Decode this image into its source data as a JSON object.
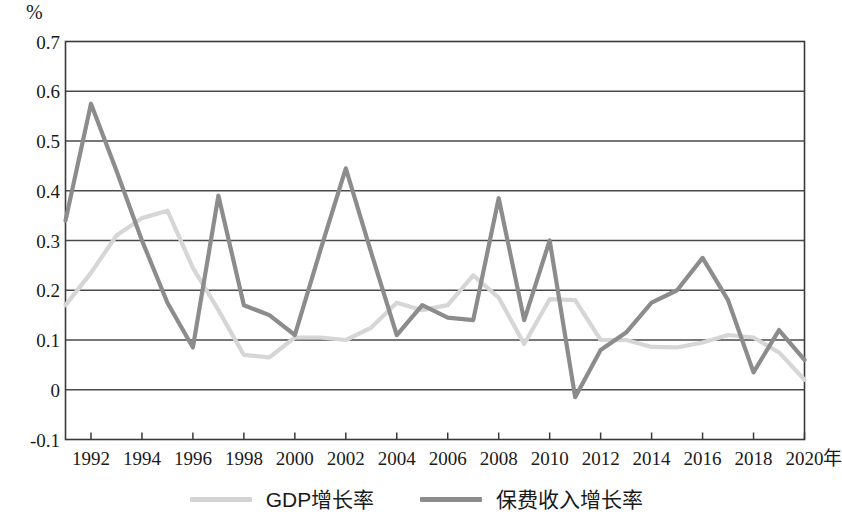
{
  "axes": {
    "y_unit": "%",
    "x_unit": "年",
    "y_ticks": [
      "0.7",
      "0.6",
      "0.5",
      "0.4",
      "0.3",
      "0.2",
      "0.1",
      "0",
      "-0.1"
    ],
    "x_ticks": [
      "1992",
      "1994",
      "1996",
      "1998",
      "2000",
      "2002",
      "2004",
      "2006",
      "2008",
      "2010",
      "2012",
      "2014",
      "2016",
      "2018",
      "2020"
    ]
  },
  "legend": {
    "items": [
      {
        "label": "GDP增长率",
        "color": "#d3d3d3"
      },
      {
        "label": "保费收入增长率",
        "color": "#8c8c8c"
      }
    ]
  },
  "chart_data": {
    "type": "line",
    "title": "",
    "xlabel": "年",
    "ylabel": "%",
    "ylim": [
      -0.1,
      0.7
    ],
    "xlim": [
      1991,
      2020
    ],
    "grid": true,
    "legend_position": "bottom",
    "x": [
      1991,
      1992,
      1993,
      1994,
      1995,
      1996,
      1997,
      1998,
      1999,
      2000,
      2001,
      2002,
      2003,
      2004,
      2005,
      2006,
      2007,
      2008,
      2009,
      2010,
      2011,
      2012,
      2013,
      2014,
      2015,
      2016,
      2017,
      2018,
      2019,
      2020
    ],
    "series": [
      {
        "name": "GDP增长率",
        "color": "#d6d6d6",
        "values": [
          0.17,
          0.235,
          0.31,
          0.345,
          0.36,
          0.245,
          0.16,
          0.07,
          0.065,
          0.105,
          0.105,
          0.1,
          0.125,
          0.175,
          0.16,
          0.17,
          0.23,
          0.185,
          0.092,
          0.182,
          0.18,
          0.1,
          0.1,
          0.086,
          0.085,
          0.095,
          0.11,
          0.105,
          0.075,
          0.02
        ]
      },
      {
        "name": "保费收入增长率",
        "color": "#8c8c8c",
        "values": [
          0.34,
          0.575,
          0.44,
          0.3,
          0.175,
          0.085,
          0.39,
          0.17,
          0.15,
          0.11,
          0.28,
          0.445,
          0.275,
          0.11,
          0.17,
          0.145,
          0.14,
          0.385,
          0.14,
          0.3,
          -0.015,
          0.08,
          0.115,
          0.175,
          0.2,
          0.265,
          0.18,
          0.035,
          0.12,
          0.06
        ]
      }
    ]
  }
}
